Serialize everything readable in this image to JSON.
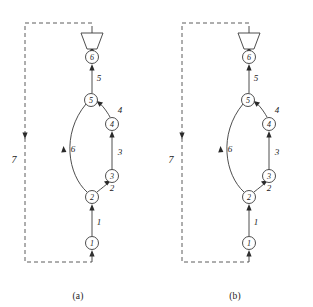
{
  "figure": {
    "panels": [
      {
        "id": "a",
        "caption": "(a)",
        "nodes": [
          {
            "id": "n1",
            "label": "1",
            "cx": 92,
            "cy": 243
          },
          {
            "id": "n2",
            "label": "2",
            "cx": 92,
            "cy": 197
          },
          {
            "id": "n3",
            "label": "3",
            "cx": 112,
            "cy": 176
          },
          {
            "id": "n4",
            "label": "4",
            "cx": 112,
            "cy": 124
          },
          {
            "id": "n5",
            "label": "5",
            "cx": 91,
            "cy": 100
          },
          {
            "id": "n6",
            "label": "6",
            "cx": 92,
            "cy": 57
          }
        ],
        "edges": [
          {
            "id": "e1",
            "label": "1",
            "from": "n1",
            "to": "n2"
          },
          {
            "id": "e2",
            "label": "2",
            "from": "n2",
            "to": "n3"
          },
          {
            "id": "e3",
            "label": "3",
            "from": "n3",
            "to": "n4"
          },
          {
            "id": "e4",
            "label": "4",
            "from": "n4",
            "to": "n5"
          },
          {
            "id": "e5",
            "label": "5",
            "from": "n5",
            "to": "n6"
          },
          {
            "id": "e6",
            "label": "6",
            "from": "n2",
            "to": "n5"
          },
          {
            "id": "e7",
            "label": "7",
            "from": "n6",
            "to": "n1",
            "style": "dashed"
          }
        ],
        "terminal_shape": "funnel"
      },
      {
        "id": "b",
        "caption": "(b)",
        "nodes": [
          {
            "id": "n1",
            "label": "1",
            "cx": 92,
            "cy": 243
          },
          {
            "id": "n2",
            "label": "2",
            "cx": 92,
            "cy": 197
          },
          {
            "id": "n3",
            "label": "3",
            "cx": 112,
            "cy": 176
          },
          {
            "id": "n4",
            "label": "4",
            "cx": 112,
            "cy": 124
          },
          {
            "id": "n5",
            "label": "5",
            "cx": 91,
            "cy": 100
          },
          {
            "id": "n6",
            "label": "6",
            "cx": 92,
            "cy": 57
          }
        ],
        "edges": [
          {
            "id": "e1",
            "label": "1",
            "from": "n1",
            "to": "n2"
          },
          {
            "id": "e2",
            "label": "2",
            "from": "n2",
            "to": "n3"
          },
          {
            "id": "e3",
            "label": "3",
            "from": "n3",
            "to": "n4"
          },
          {
            "id": "e4",
            "label": "4",
            "from": "n4",
            "to": "n5"
          },
          {
            "id": "e5",
            "label": "5",
            "from": "n5",
            "to": "n6"
          },
          {
            "id": "e6",
            "label": "6",
            "from": "n2",
            "to": "n5"
          },
          {
            "id": "e7",
            "label": "7",
            "from": "n6",
            "to": "n1",
            "style": "dashed"
          }
        ],
        "terminal_shape": "funnel"
      }
    ],
    "colors": {
      "stroke": "#3a3a3a",
      "arrow": "#2a2a2a",
      "dashed_stroke": "#4a4a4a",
      "text": "#1b1b1b",
      "background": "#ffffff"
    },
    "node_radius": 6.5
  }
}
